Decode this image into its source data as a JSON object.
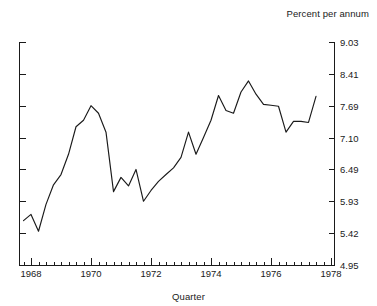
{
  "chart_data": {
    "type": "line",
    "title": "",
    "unit_title": "Percent per annum",
    "xlabel": "Quarter",
    "ylabel": "",
    "grid": false,
    "legend": null,
    "y_axis_side": "right",
    "ytick_labels": [
      "9.03",
      "8.41",
      "7.69",
      "7.10",
      "6.49",
      "5.93",
      "5.42",
      "4.95"
    ],
    "ytick_values": [
      9.03,
      8.41,
      7.69,
      7.1,
      6.49,
      5.93,
      5.42,
      4.95
    ],
    "ylim": [
      4.95,
      9.03
    ],
    "xtick_labels": [
      "1968",
      "1970",
      "1972",
      "1974",
      "1976",
      "1978"
    ],
    "xtick_values": [
      1968,
      1970,
      1972,
      1974,
      1976,
      1978
    ],
    "xlim": [
      1967.6,
      1978.1
    ],
    "minor_x_step": 0.25,
    "line_color": "#1a1a1a",
    "series": [
      {
        "name": "Interest rate",
        "x": [
          1967.75,
          1968.0,
          1968.25,
          1968.5,
          1968.75,
          1969.0,
          1969.25,
          1969.5,
          1969.75,
          1970.0,
          1970.25,
          1970.5,
          1970.75,
          1971.0,
          1971.25,
          1971.5,
          1971.75,
          1972.0,
          1972.25,
          1972.5,
          1972.75,
          1973.0,
          1973.25,
          1973.5,
          1973.75,
          1974.0,
          1974.25,
          1974.5,
          1974.75,
          1975.0,
          1975.25,
          1975.5,
          1975.75,
          1976.0,
          1976.25,
          1976.5,
          1976.75,
          1977.0,
          1977.25,
          1977.5
        ],
        "values": [
          5.62,
          5.72,
          5.45,
          5.88,
          6.22,
          6.4,
          6.78,
          7.3,
          7.42,
          7.69,
          7.55,
          7.2,
          6.1,
          6.35,
          6.2,
          6.49,
          5.93,
          6.12,
          6.28,
          6.4,
          6.52,
          6.72,
          7.2,
          6.78,
          7.1,
          7.42,
          7.92,
          7.6,
          7.55,
          8.0,
          8.25,
          7.95,
          7.72,
          7.7,
          7.68,
          7.2,
          7.4,
          7.4,
          7.38,
          7.9
        ]
      }
    ]
  },
  "plot_geometry": {
    "left": 19,
    "right": 334,
    "top": 42,
    "bottom": 265
  }
}
